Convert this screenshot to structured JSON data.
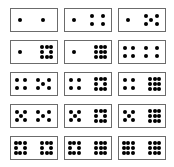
{
  "colors": {
    "border": "#6b6b6b",
    "dot": "#000000",
    "background": "#ffffff"
  },
  "cards": [
    {
      "left": 1,
      "right": 1
    },
    {
      "left": 1,
      "right": 4
    },
    {
      "left": 1,
      "right": 5
    },
    {
      "left": 1,
      "right": 8
    },
    {
      "left": 1,
      "right": 9
    },
    {
      "left": 4,
      "right": 4
    },
    {
      "left": 4,
      "right": 5
    },
    {
      "left": 4,
      "right": 8
    },
    {
      "left": 4,
      "right": 9
    },
    {
      "left": 5,
      "right": 5
    },
    {
      "left": 5,
      "right": 8
    },
    {
      "left": 5,
      "right": 9
    },
    {
      "left": 8,
      "right": 8
    },
    {
      "left": 8,
      "right": 9
    },
    {
      "left": 9,
      "right": 9
    }
  ]
}
